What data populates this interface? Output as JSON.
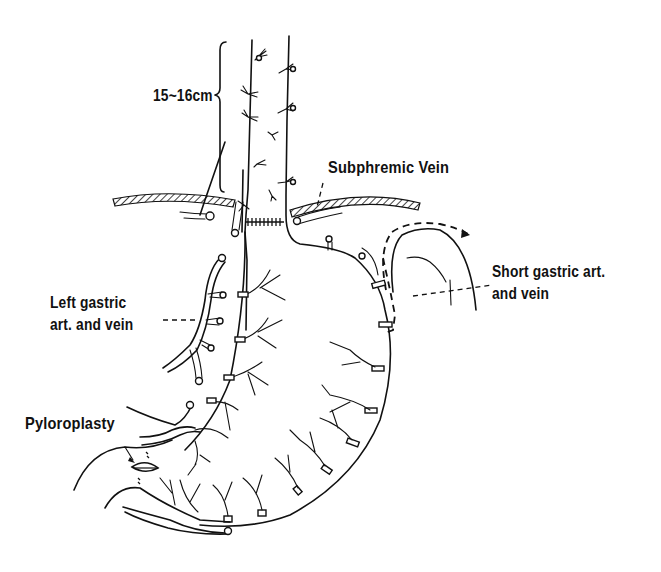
{
  "diagram": {
    "type": "surgical illustration",
    "labels": {
      "length": "15~16cm",
      "subphremic_vein": "Subphremic Vein",
      "short_gastric_line1": "Short gastric art.",
      "short_gastric_line2": "and vein",
      "left_gastric_line1": "Left gastric",
      "left_gastric_line2": "art. and vein",
      "pyloroplasty": "Pyloroplasty"
    },
    "colors": {
      "ink": "#111111",
      "background": "#ffffff"
    }
  }
}
